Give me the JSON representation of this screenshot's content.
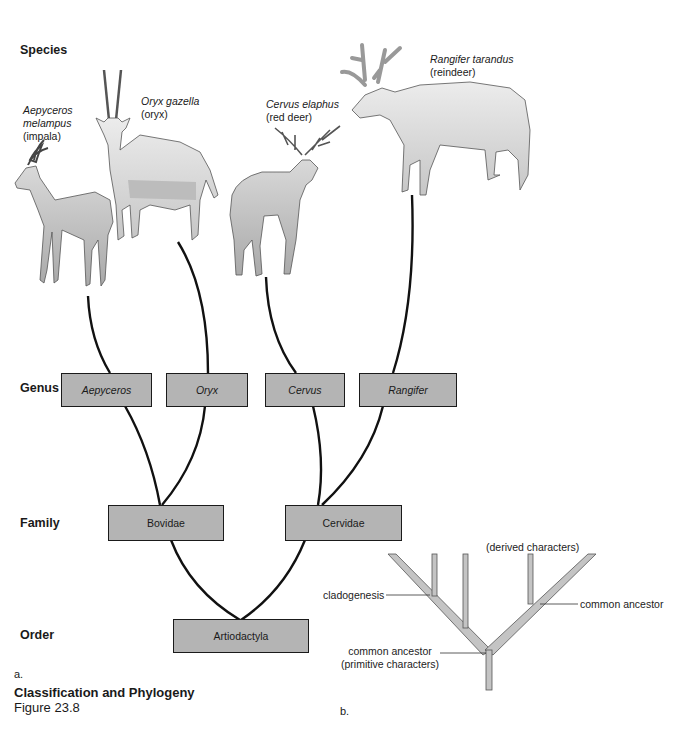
{
  "ranks": {
    "species": "Species",
    "genus": "Genus",
    "family": "Family",
    "order": "Order"
  },
  "species": [
    {
      "scientific_line1": "Aepyceros",
      "scientific_line2": "melampus",
      "common": "(impala)"
    },
    {
      "scientific": "Oryx gazella",
      "common": "(oryx)"
    },
    {
      "scientific": "Cervus elaphus",
      "common": "(red deer)"
    },
    {
      "scientific": "Rangifer tarandus",
      "common": "(reindeer)"
    }
  ],
  "genus": [
    "Aepyceros",
    "Oryx",
    "Cervus",
    "Rangifer"
  ],
  "family": [
    "Bovidae",
    "Cervidae"
  ],
  "order": [
    "Artiodactyla"
  ],
  "cladogram": {
    "derived": "(derived characters)",
    "cladogenesis": "cladogenesis",
    "common_ancestor": "common ancestor",
    "root_line1": "common ancestor",
    "root_line2": "(primitive characters)"
  },
  "panel_labels": {
    "a": "a.",
    "b": "b."
  },
  "caption": {
    "title": "Classification and Phylogeny",
    "figure": "Figure 23.8"
  },
  "colors": {
    "box_fill": "#b4b4b4",
    "line": "#111111",
    "branch_fill": "#c4c4c4"
  }
}
